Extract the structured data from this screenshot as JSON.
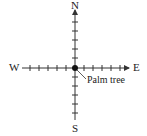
{
  "diagram": {
    "type": "compass-axes",
    "labels": {
      "north": "N",
      "south": "S",
      "east": "E",
      "west": "W"
    },
    "origin_label": "Palm tree",
    "colors": {
      "line": "#333333",
      "text": "#222222",
      "background": "#ffffff"
    },
    "ticks_per_half_axis": 6
  }
}
